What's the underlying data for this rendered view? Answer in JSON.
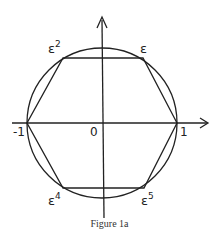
{
  "figure": {
    "caption": "Figure 1a",
    "labels": {
      "origin": "0",
      "minus_one": "-1",
      "one": "1",
      "eps1_base": "ε",
      "eps2_base": "ε",
      "eps2_exp": "2",
      "eps4_base": "ε",
      "eps4_exp": "4",
      "eps5_base": "ε",
      "eps5_exp": "5"
    },
    "stroke_color": "#222222",
    "background_color": "#ffffff"
  }
}
